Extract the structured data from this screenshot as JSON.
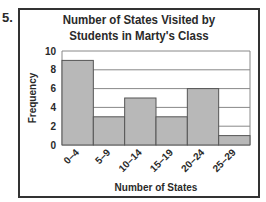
{
  "question_number": "5.",
  "chart_data": {
    "type": "bar",
    "title": "Number of States Visited by Students in Marty's Class",
    "title_lines": [
      "Number of States Visited by",
      "Students in Marty's Class"
    ],
    "xlabel": "Number of States",
    "ylabel": "Frequency",
    "categories": [
      "0–4",
      "5–9",
      "10–14",
      "15–19",
      "20–24",
      "25–29"
    ],
    "values": [
      9,
      3,
      5,
      3,
      6,
      1
    ],
    "yticks": [
      0,
      2,
      4,
      6,
      8,
      10
    ],
    "ylim": [
      0,
      10
    ],
    "grid": true,
    "bar_color": "#b8b8b8",
    "histogram": true
  }
}
